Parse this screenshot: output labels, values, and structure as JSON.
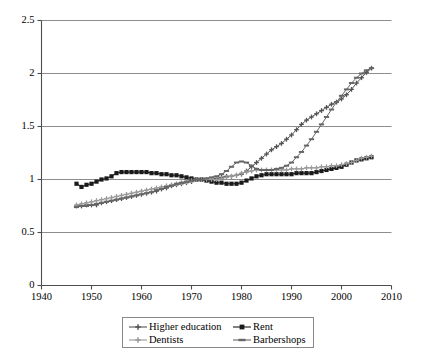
{
  "chart_data": {
    "type": "line",
    "title": "",
    "xlabel": "",
    "ylabel": "",
    "xlim": [
      1940,
      2010
    ],
    "ylim": [
      0,
      2.5
    ],
    "xticks": [
      1940,
      1950,
      1960,
      1970,
      1980,
      1990,
      2000,
      2010
    ],
    "yticks": [
      "0",
      "0.5",
      "1",
      "1.5",
      "2",
      "2.5"
    ],
    "ytick_values": [
      0,
      0.5,
      1,
      1.5,
      2,
      2.5
    ],
    "grid": "horizontal",
    "legend_position": "bottom",
    "x": [
      1947,
      1948,
      1949,
      1950,
      1951,
      1952,
      1953,
      1954,
      1955,
      1956,
      1957,
      1958,
      1959,
      1960,
      1961,
      1962,
      1963,
      1964,
      1965,
      1966,
      1967,
      1968,
      1969,
      1970,
      1971,
      1972,
      1973,
      1974,
      1975,
      1976,
      1977,
      1978,
      1979,
      1980,
      1981,
      1982,
      1983,
      1984,
      1985,
      1986,
      1987,
      1988,
      1989,
      1990,
      1991,
      1992,
      1993,
      1994,
      1995,
      1996,
      1997,
      1998,
      1999,
      2000,
      2001,
      2002,
      2003,
      2004,
      2005,
      2006
    ],
    "series": [
      {
        "name": "Higher education",
        "color": "#555555",
        "marker": "plus",
        "values": [
          0.75,
          0.75,
          0.76,
          0.76,
          0.76,
          0.78,
          0.79,
          0.8,
          0.81,
          0.82,
          0.83,
          0.84,
          0.85,
          0.86,
          0.87,
          0.88,
          0.89,
          0.91,
          0.92,
          0.94,
          0.95,
          0.96,
          0.97,
          0.98,
          1.0,
          1.0,
          1.0,
          1.0,
          1.01,
          1.02,
          1.03,
          1.03,
          1.04,
          1.05,
          1.08,
          1.12,
          1.16,
          1.2,
          1.24,
          1.28,
          1.31,
          1.34,
          1.38,
          1.42,
          1.47,
          1.52,
          1.56,
          1.59,
          1.62,
          1.65,
          1.68,
          1.71,
          1.73,
          1.76,
          1.8,
          1.85,
          1.91,
          1.96,
          2.01,
          2.05
        ]
      },
      {
        "name": "Rent",
        "color": "#1a1a1a",
        "marker": "square",
        "values": [
          0.96,
          0.93,
          0.95,
          0.96,
          0.98,
          1.0,
          1.01,
          1.03,
          1.06,
          1.07,
          1.07,
          1.07,
          1.07,
          1.07,
          1.07,
          1.06,
          1.06,
          1.05,
          1.05,
          1.04,
          1.04,
          1.03,
          1.02,
          1.01,
          1.0,
          1.0,
          0.99,
          0.98,
          0.97,
          0.97,
          0.96,
          0.96,
          0.96,
          0.97,
          0.99,
          1.01,
          1.03,
          1.04,
          1.05,
          1.05,
          1.05,
          1.05,
          1.05,
          1.05,
          1.06,
          1.06,
          1.06,
          1.06,
          1.07,
          1.08,
          1.09,
          1.1,
          1.11,
          1.12,
          1.14,
          1.16,
          1.18,
          1.19,
          1.2,
          1.21
        ]
      },
      {
        "name": "Dentists",
        "color": "#999999",
        "marker": "plus",
        "values": [
          0.76,
          0.77,
          0.78,
          0.79,
          0.8,
          0.81,
          0.82,
          0.83,
          0.84,
          0.85,
          0.86,
          0.87,
          0.88,
          0.89,
          0.9,
          0.91,
          0.92,
          0.93,
          0.94,
          0.95,
          0.96,
          0.97,
          0.98,
          0.99,
          1.0,
          1.0,
          1.0,
          1.0,
          1.0,
          1.01,
          1.02,
          1.03,
          1.04,
          1.06,
          1.07,
          1.08,
          1.09,
          1.09,
          1.09,
          1.09,
          1.09,
          1.09,
          1.09,
          1.1,
          1.1,
          1.1,
          1.11,
          1.11,
          1.11,
          1.12,
          1.12,
          1.13,
          1.13,
          1.14,
          1.15,
          1.16,
          1.18,
          1.2,
          1.21,
          1.22
        ]
      },
      {
        "name": "Barbershops",
        "color": "#666666",
        "marker": "dash",
        "values": [
          0.74,
          0.75,
          0.75,
          0.76,
          0.77,
          0.78,
          0.79,
          0.8,
          0.81,
          0.82,
          0.83,
          0.84,
          0.85,
          0.86,
          0.87,
          0.88,
          0.9,
          0.91,
          0.93,
          0.94,
          0.96,
          0.97,
          0.98,
          0.99,
          1.0,
          1.0,
          1.01,
          1.02,
          1.03,
          1.05,
          1.08,
          1.12,
          1.16,
          1.17,
          1.16,
          1.13,
          1.1,
          1.09,
          1.09,
          1.09,
          1.1,
          1.11,
          1.13,
          1.16,
          1.21,
          1.26,
          1.32,
          1.38,
          1.45,
          1.52,
          1.59,
          1.66,
          1.73,
          1.79,
          1.85,
          1.91,
          1.96,
          2.0,
          2.03,
          2.05
        ]
      }
    ]
  },
  "legend": {
    "items": [
      {
        "label": "Higher education"
      },
      {
        "label": "Rent"
      },
      {
        "label": "Dentists"
      },
      {
        "label": "Barbershops"
      }
    ]
  }
}
